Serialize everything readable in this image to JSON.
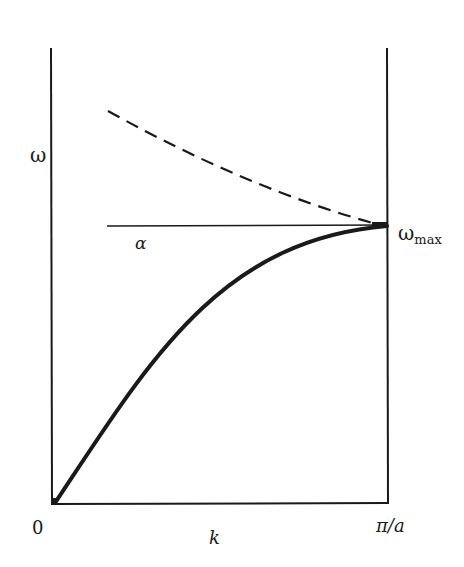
{
  "diagram": {
    "type": "dispersion-relation",
    "y_axis_label": "ω",
    "x_axis_label": "k",
    "origin_label": "0",
    "x_max_label": "π/a",
    "omega_max_label": "ω",
    "omega_max_subscript": "max",
    "alpha_label": "α",
    "curves": [
      {
        "name": "acoustic-branch",
        "style": "solid-thick",
        "description": "Rises from origin, concave down, flattening to ω_max at k = π/a"
      },
      {
        "name": "upper-branch",
        "style": "dashed",
        "description": "Decreasing from upper-left, meeting ω_max at k = π/a"
      },
      {
        "name": "omega-max-line",
        "style": "thin-horizontal",
        "description": "Horizontal reference line at ω_max labeled α"
      }
    ],
    "colors": {
      "ink": "#1a1a1a",
      "background": "#ffffff"
    }
  }
}
